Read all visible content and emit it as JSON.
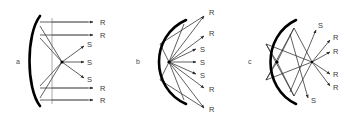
{
  "figure": {
    "width": 344,
    "height": 123,
    "background": "#ffffff",
    "ink_color": "#000000",
    "ray_color": "#2b2b2b",
    "label_color": "#3a3a3a",
    "panels": [
      {
        "id": "panel-a",
        "caption": "a",
        "caption_pos": {
          "x": 16,
          "y": 64
        },
        "mirror": {
          "type": "concave-arc",
          "path": "M 40 16 C 26 34, 26 88, 40 106"
        },
        "focus": {
          "x": 62,
          "y": 62
        },
        "axis_lines": [
          {
            "x1": 52,
            "y1": 18,
            "x2": 52,
            "y2": 104
          },
          {
            "x1": 52,
            "y1": 22,
            "x2": 88,
            "y2": 22
          },
          {
            "x1": 52,
            "y1": 35,
            "x2": 88,
            "y2": 35
          },
          {
            "x1": 52,
            "y1": 88,
            "x2": 88,
            "y2": 88
          },
          {
            "x1": 52,
            "y1": 100,
            "x2": 88,
            "y2": 100
          }
        ],
        "rays": [
          {
            "label": "R",
            "x1": 40,
            "y1": 22,
            "x2": 93,
            "y2": 22,
            "label_x": 100,
            "label_y": 25
          },
          {
            "label": "R",
            "x1": 40,
            "y1": 35,
            "x2": 93,
            "y2": 35,
            "label_x": 100,
            "label_y": 38
          },
          {
            "label": "S",
            "x1": 62,
            "y1": 62,
            "x2": 84,
            "y2": 46,
            "label_x": 87,
            "label_y": 47
          },
          {
            "label": "S",
            "x1": 62,
            "y1": 62,
            "x2": 84,
            "y2": 62,
            "label_x": 87,
            "label_y": 65
          },
          {
            "label": "S",
            "x1": 62,
            "y1": 62,
            "x2": 84,
            "y2": 78,
            "label_x": 87,
            "label_y": 82
          },
          {
            "label": "R",
            "x1": 40,
            "y1": 88,
            "x2": 93,
            "y2": 88,
            "label_x": 100,
            "label_y": 91
          },
          {
            "label": "R",
            "x1": 40,
            "y1": 100,
            "x2": 93,
            "y2": 100,
            "label_x": 100,
            "label_y": 103
          }
        ],
        "focus_links": [
          {
            "x1": 62,
            "y1": 62,
            "x2": 40,
            "y2": 26
          },
          {
            "x1": 62,
            "y1": 62,
            "x2": 40,
            "y2": 38
          },
          {
            "x1": 62,
            "y1": 62,
            "x2": 40,
            "y2": 86
          },
          {
            "x1": 62,
            "y1": 62,
            "x2": 40,
            "y2": 98
          }
        ]
      },
      {
        "id": "panel-b",
        "caption": "b",
        "caption_pos": {
          "x": 136,
          "y": 64
        },
        "mirror": {
          "type": "concave-arc",
          "path": "M 186 20 C 150 36, 150 88, 186 104"
        },
        "focus": {
          "x": 169,
          "y": 62
        },
        "axis_lines": [],
        "rays": [
          {
            "label": "R",
            "x1": 169,
            "y1": 62,
            "x2": 204,
            "y2": 16,
            "label_x": 209,
            "label_y": 15
          },
          {
            "label": "R",
            "x1": 169,
            "y1": 62,
            "x2": 204,
            "y2": 36,
            "label_x": 209,
            "label_y": 36
          },
          {
            "label": "S",
            "x1": 169,
            "y1": 62,
            "x2": 196,
            "y2": 49,
            "label_x": 200,
            "label_y": 52
          },
          {
            "label": "S",
            "x1": 169,
            "y1": 62,
            "x2": 196,
            "y2": 62,
            "label_x": 200,
            "label_y": 65
          },
          {
            "label": "S",
            "x1": 169,
            "y1": 62,
            "x2": 196,
            "y2": 74,
            "label_x": 200,
            "label_y": 78
          },
          {
            "label": "R",
            "x1": 169,
            "y1": 62,
            "x2": 204,
            "y2": 88,
            "label_x": 209,
            "label_y": 92
          },
          {
            "label": "R",
            "x1": 169,
            "y1": 62,
            "x2": 204,
            "y2": 108,
            "label_x": 209,
            "label_y": 112
          }
        ],
        "focus_links": [
          {
            "x1": 169,
            "y1": 62,
            "x2": 184,
            "y2": 24
          },
          {
            "x1": 169,
            "y1": 62,
            "x2": 160,
            "y2": 44
          },
          {
            "x1": 169,
            "y1": 62,
            "x2": 160,
            "y2": 80
          },
          {
            "x1": 169,
            "y1": 62,
            "x2": 184,
            "y2": 100
          },
          {
            "x1": 160,
            "y1": 44,
            "x2": 204,
            "y2": 16
          },
          {
            "x1": 160,
            "y1": 80,
            "x2": 204,
            "y2": 108
          }
        ]
      },
      {
        "id": "panel-c",
        "caption": "c",
        "caption_pos": {
          "x": 248,
          "y": 64
        },
        "mirror": {
          "type": "concave-arc",
          "path": "M 296 20 C 262 36, 262 88, 296 104"
        },
        "focus": {
          "x": 277,
          "y": 62
        },
        "converge": {
          "x": 312,
          "y": 62
        },
        "axis_lines": [],
        "rays": [
          {
            "label": "S",
            "x1": 290,
            "y1": 92,
            "x2": 316,
            "y2": 30,
            "label_x": 318,
            "label_y": 28
          },
          {
            "label": "R",
            "x1": 312,
            "y1": 62,
            "x2": 330,
            "y2": 40,
            "label_x": 333,
            "label_y": 40
          },
          {
            "label": "R",
            "x1": 312,
            "y1": 62,
            "x2": 330,
            "y2": 52,
            "label_x": 333,
            "label_y": 54
          },
          {
            "label": "R",
            "x1": 312,
            "y1": 62,
            "x2": 330,
            "y2": 74,
            "label_x": 333,
            "label_y": 77
          },
          {
            "label": "R",
            "x1": 312,
            "y1": 62,
            "x2": 330,
            "y2": 86,
            "label_x": 333,
            "label_y": 90
          },
          {
            "label": "S",
            "x1": 290,
            "y1": 34,
            "x2": 308,
            "y2": 98,
            "label_x": 311,
            "label_y": 103
          }
        ],
        "focus_links": [
          {
            "x1": 277,
            "y1": 62,
            "x2": 294,
            "y2": 28
          },
          {
            "x1": 277,
            "y1": 62,
            "x2": 266,
            "y2": 44
          },
          {
            "x1": 277,
            "y1": 62,
            "x2": 266,
            "y2": 80
          },
          {
            "x1": 277,
            "y1": 62,
            "x2": 294,
            "y2": 96
          },
          {
            "x1": 294,
            "y1": 28,
            "x2": 312,
            "y2": 62
          },
          {
            "x1": 266,
            "y1": 44,
            "x2": 312,
            "y2": 62
          },
          {
            "x1": 266,
            "y1": 80,
            "x2": 312,
            "y2": 62
          },
          {
            "x1": 294,
            "y1": 96,
            "x2": 312,
            "y2": 62
          },
          {
            "x1": 266,
            "y1": 44,
            "x2": 294,
            "y2": 96
          },
          {
            "x1": 266,
            "y1": 80,
            "x2": 294,
            "y2": 28
          }
        ]
      }
    ]
  }
}
